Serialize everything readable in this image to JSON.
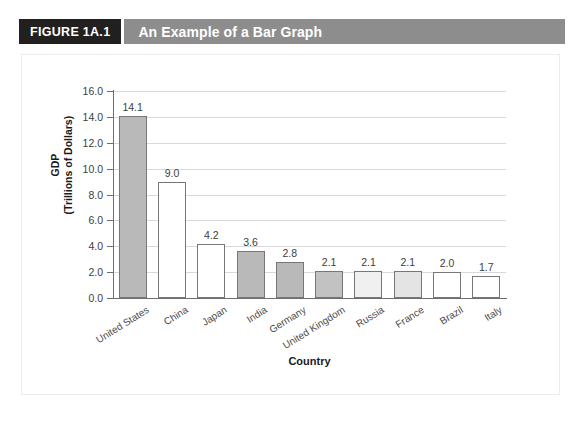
{
  "figure": {
    "number_label": "FIGURE 1A.1",
    "title": "An Example of a Bar Graph",
    "number_box_color": "#221f1f",
    "title_bar_color": "#8d8d8d",
    "title_text_color": "#ffffff"
  },
  "chart_data": {
    "type": "bar",
    "title": "An Example of a Bar Graph",
    "xlabel": "Country",
    "ylabel": "GDP\n(Trillions of Dollars)",
    "ylabel_line1": "GDP",
    "ylabel_line2": "(Trillions of Dollars)",
    "categories": [
      "United States",
      "China",
      "Japan",
      "India",
      "Germany",
      "United Kingdom",
      "Russia",
      "France",
      "Brazil",
      "Italy"
    ],
    "values": [
      14.1,
      9.0,
      4.2,
      3.6,
      2.8,
      2.1,
      2.1,
      2.1,
      2.0,
      1.7
    ],
    "value_labels": [
      "14.1",
      "9.0",
      "4.2",
      "3.6",
      "2.8",
      "2.1",
      "2.1",
      "2.1",
      "2.0",
      "1.7"
    ],
    "bar_fills": [
      "#b9b9b9",
      "#ffffff",
      "#ffffff",
      "#b9b9b9",
      "#b9b9b9",
      "#c2c2c2",
      "#f0f0f0",
      "#e4e4e4",
      "#ffffff",
      "#ffffff"
    ],
    "bar_border_color": "#777777",
    "ylim": [
      0.0,
      16.0
    ],
    "ytick_step": 2.0,
    "ytick_labels": [
      "16.0",
      "14.0",
      "12.0",
      "10.0",
      "8.0",
      "6.0",
      "4.0",
      "2.0",
      "0.0"
    ],
    "ytick_values": [
      16.0,
      14.0,
      12.0,
      10.0,
      8.0,
      6.0,
      4.0,
      2.0,
      0.0
    ],
    "grid": "horizontal",
    "gridline_color": "#d9d9d9",
    "axis_color": "#6e6e6e",
    "legend": "none",
    "xtick_label_rotation": -32
  }
}
